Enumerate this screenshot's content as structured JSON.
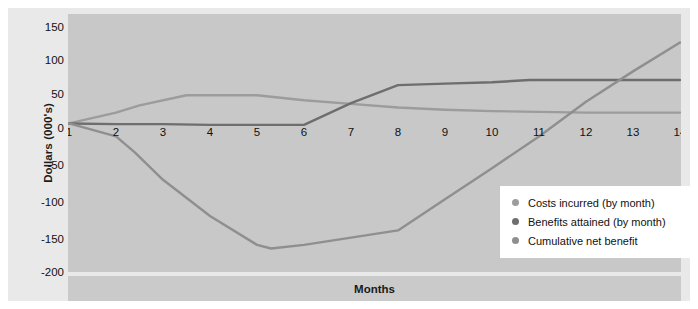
{
  "chart_data": {
    "type": "line",
    "title": "",
    "xlabel": "Months",
    "ylabel": "Dollars (000's)",
    "x": [
      1,
      2,
      3,
      4,
      5,
      6,
      7,
      8,
      9,
      10,
      11,
      12,
      13,
      14
    ],
    "xticklabels": [
      "1",
      "2",
      "3",
      "4",
      "5",
      "6",
      "7",
      "8",
      "9",
      "10",
      "11",
      "12",
      "13",
      "14"
    ],
    "yticklabels": [
      "150",
      "100",
      "50",
      "0",
      "-50",
      "-100",
      "-150",
      "-200"
    ],
    "yticks": [
      150,
      100,
      50,
      0,
      -50,
      -100,
      -150,
      -200
    ],
    "xlim": [
      1,
      14
    ],
    "ylim": [
      -200,
      150
    ],
    "grid": false,
    "legend_position": "lower-right",
    "series": [
      {
        "name": "Costs incurred (by month)",
        "color": "#9c9c9c",
        "points": [
          [
            1,
            0
          ],
          [
            2,
            15
          ],
          [
            2.5,
            25
          ],
          [
            3.5,
            39
          ],
          [
            5,
            39
          ],
          [
            6,
            32
          ],
          [
            7,
            27
          ],
          [
            8,
            22
          ],
          [
            9,
            19
          ],
          [
            10,
            17
          ],
          [
            11,
            16
          ],
          [
            12,
            15
          ],
          [
            13,
            15
          ],
          [
            14,
            15
          ]
        ]
      },
      {
        "name": "Benefits attained (by month)",
        "color": "#6e6e6e",
        "points": [
          [
            1,
            0
          ],
          [
            2,
            -1
          ],
          [
            3,
            -1
          ],
          [
            4,
            -2
          ],
          [
            5,
            -2
          ],
          [
            6,
            -2
          ],
          [
            7,
            28
          ],
          [
            8,
            53
          ],
          [
            9,
            55
          ],
          [
            10,
            57
          ],
          [
            10.8,
            60
          ],
          [
            12,
            60
          ],
          [
            13,
            60
          ],
          [
            14,
            60
          ]
        ]
      },
      {
        "name": "Cumulative net benefit",
        "color": "#8f8f8f",
        "points": [
          [
            1,
            0
          ],
          [
            2,
            -18
          ],
          [
            2.4,
            -40
          ],
          [
            3,
            -78
          ],
          [
            4,
            -128
          ],
          [
            5,
            -168
          ],
          [
            5.3,
            -173
          ],
          [
            6,
            -168
          ],
          [
            7,
            -158
          ],
          [
            8,
            -148
          ],
          [
            9,
            -105
          ],
          [
            10,
            -62
          ],
          [
            11,
            -18
          ],
          [
            12,
            30
          ],
          [
            13,
            72
          ],
          [
            14,
            112
          ]
        ]
      }
    ]
  },
  "legend": {
    "items": [
      {
        "label": "Costs incurred (by month)",
        "color": "#9c9c9c"
      },
      {
        "label": "Benefits attained (by month)",
        "color": "#6e6e6e"
      },
      {
        "label": "Cumulative net benefit",
        "color": "#8f8f8f"
      }
    ]
  },
  "colors": {
    "outer_band": "#e9e9e9",
    "plot_background": "#c8c8c8",
    "axis_title_band": "#cacaca",
    "legend_background": "#ffffff",
    "text": "#111111"
  }
}
